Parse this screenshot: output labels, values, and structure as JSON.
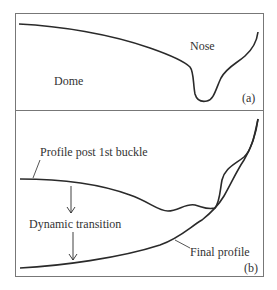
{
  "panel_a": {
    "labels": {
      "dome": "Dome",
      "nose": "Nose",
      "tag": "(a)"
    }
  },
  "panel_b": {
    "labels": {
      "profile_post_buckle": "Profile post 1st buckle",
      "dynamic_transition": "Dynamic transition",
      "final_profile": "Final profile",
      "tag": "(b)"
    }
  },
  "colors": {
    "line": "#2a2a2a",
    "frame": "#777777",
    "text": "#333333"
  }
}
